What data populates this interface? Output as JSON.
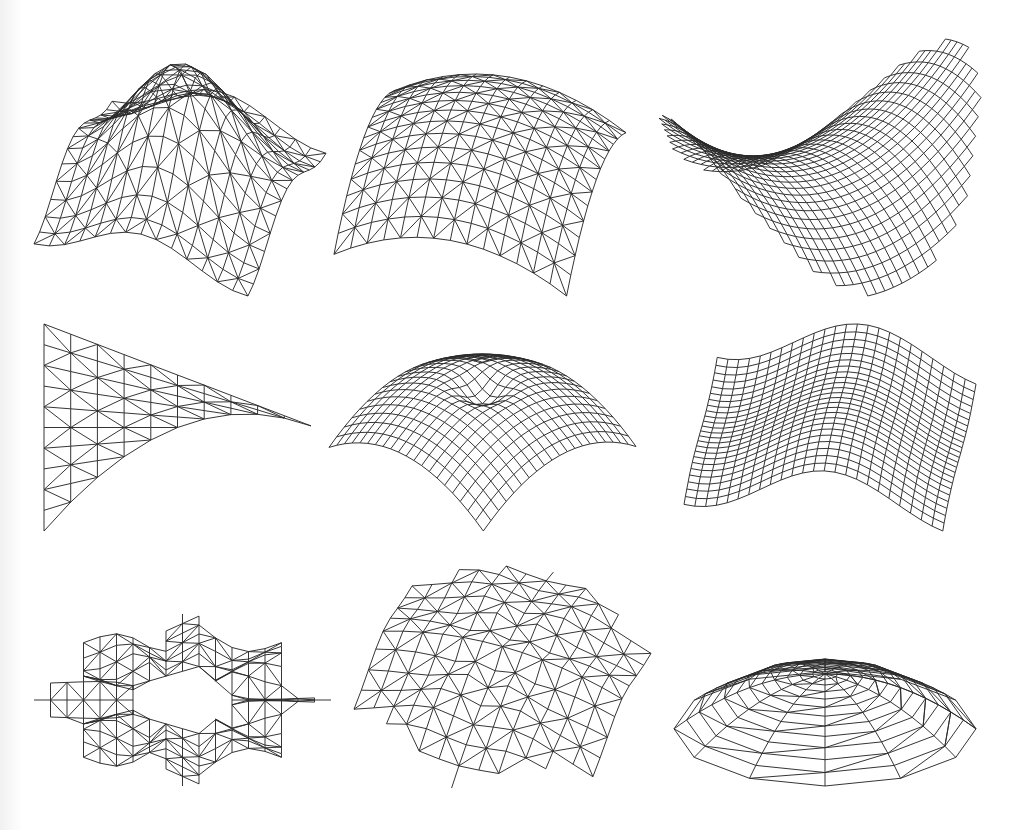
{
  "figure": {
    "stroke_color": "#2a2a2a",
    "background": "#ffffff",
    "panels": [
      {
        "id": "a",
        "name": "four-lobed-vault",
        "mesh": "triangular",
        "outline": "square",
        "shape": "fourlobe",
        "n": 14,
        "box": [
          30,
          60,
          300,
          240
        ],
        "rx": 0.95,
        "ry": 0.95,
        "tilt": 0.55,
        "rot": 0.35,
        "amp": 0.55
      },
      {
        "id": "b",
        "name": "square-dome",
        "mesh": "triangular",
        "outline": "square",
        "shape": "dome",
        "n": 14,
        "box": [
          330,
          70,
          300,
          230
        ],
        "rx": 1.0,
        "ry": 1.0,
        "tilt": 0.5,
        "rot": 0.25,
        "amp": 0.45
      },
      {
        "id": "c",
        "name": "twisted-saddle-shell",
        "mesh": "quad-fine",
        "outline": "ellipse",
        "shape": "saddle",
        "n": 32,
        "box": [
          655,
          35,
          330,
          265
        ],
        "rx": 1.0,
        "ry": 1.0,
        "tilt": 0.55,
        "rot": -0.6,
        "amp": 0.7
      },
      {
        "id": "d",
        "name": "triangular-hypar",
        "mesh": "triangular",
        "outline": "triangle",
        "shape": "hypar",
        "n": 10,
        "box": [
          40,
          320,
          275,
          215
        ],
        "rx": 1.0,
        "ry": 1.0,
        "tilt": 0.3,
        "rot": 0.0,
        "amp": 0.3
      },
      {
        "id": "e",
        "name": "dome-with-central-dimple",
        "mesh": "quad",
        "outline": "square",
        "shape": "dimple",
        "n": 20,
        "box": [
          325,
          350,
          315,
          185
        ],
        "rx": 1.0,
        "ry": 1.0,
        "tilt": 0.42,
        "rot": 0.78,
        "amp": 0.5
      },
      {
        "id": "f",
        "name": "wavy-sheet",
        "mesh": "quad",
        "outline": "square",
        "shape": "wave",
        "n": 24,
        "box": [
          680,
          320,
          300,
          215
        ],
        "rx": 1.0,
        "ry": 0.85,
        "tilt": 0.5,
        "rot": 0.15,
        "amp": 0.2
      },
      {
        "id": "g",
        "name": "perforated-ring-plate",
        "mesh": "triangular",
        "outline": "star",
        "shape": "ring",
        "n": 18,
        "box": [
          30,
          610,
          305,
          180
        ],
        "rx": 1.0,
        "ry": 1.0,
        "tilt": 0.45,
        "rot": 0.0,
        "amp": 0.1
      },
      {
        "id": "h",
        "name": "hexagonal-dome",
        "mesh": "triangular",
        "outline": "hexagon",
        "shape": "hexdome",
        "n": 14,
        "box": [
          350,
          562,
          305,
          230
        ],
        "rx": 1.0,
        "ry": 1.0,
        "tilt": 0.6,
        "rot": 0.35,
        "amp": 0.25
      },
      {
        "id": "i",
        "name": "radial-shallow-dome",
        "mesh": "radial",
        "outline": "circle",
        "shape": "radialdome",
        "n": 12,
        "box": [
          670,
          655,
          310,
          135
        ],
        "rx": 1.0,
        "ry": 1.0,
        "tilt": 0.35,
        "rot": 0.0,
        "amp": 0.35
      }
    ]
  }
}
